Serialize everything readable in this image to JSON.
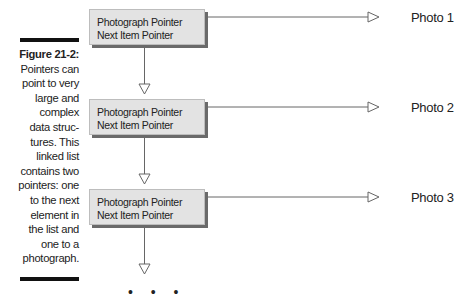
{
  "caption": {
    "figure_label": "Figure 21-2:",
    "text_lines": [
      "Pointers can",
      "point to very",
      "large and",
      "complex",
      "data struc-",
      "tures. This",
      "linked list",
      "contains two",
      "pointers: one",
      "to the next",
      "element in",
      "the list and",
      "one to a",
      "photograph."
    ]
  },
  "nodes": [
    {
      "line1": "Photograph Pointer",
      "line2": "Next Item Pointer",
      "photo": "Photo 1"
    },
    {
      "line1": "Photograph Pointer",
      "line2": "Next Item Pointer",
      "photo": "Photo 2"
    },
    {
      "line1": "Photograph Pointer",
      "line2": "Next Item Pointer",
      "photo": "Photo 3"
    }
  ],
  "continuation": "• • •"
}
